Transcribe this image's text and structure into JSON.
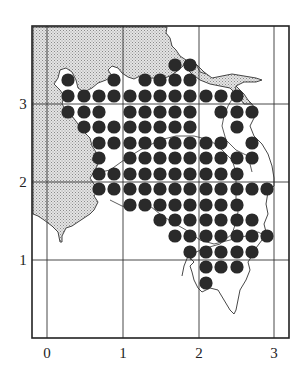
{
  "figure": {
    "type": "grid-distribution-map",
    "frame": {
      "left": 32,
      "top": 26,
      "right": 289,
      "bottom": 338
    },
    "colors": {
      "dot": "#2a2a2a",
      "land_shade": "#cfcfcf",
      "grid": "#333333",
      "coast": "#333333",
      "background": "#ffffff"
    },
    "x_axis": {
      "ticks": [
        {
          "label": "0",
          "px": 47
        },
        {
          "label": "1",
          "px": 123
        },
        {
          "label": "2",
          "px": 199
        },
        {
          "label": "3",
          "px": 274
        }
      ]
    },
    "y_axis": {
      "ticks": [
        {
          "label": "3",
          "px": 104
        },
        {
          "label": "2",
          "px": 182
        },
        {
          "label": "1",
          "px": 260
        }
      ]
    },
    "dot_radius": 6.6,
    "dot_columns_px": [
      68,
      84,
      99,
      114,
      130,
      145,
      160,
      175,
      190,
      206,
      221,
      237,
      252,
      267
    ],
    "dot_rows": [
      {
        "y": 65,
        "x": [
          175,
          190
        ]
      },
      {
        "y": 80,
        "x": [
          68,
          114,
          145,
          160,
          175,
          190
        ]
      },
      {
        "y": 96,
        "x": [
          68,
          84,
          99,
          114,
          130,
          145,
          160,
          175,
          190,
          206,
          221,
          237
        ]
      },
      {
        "y": 112,
        "x": [
          68,
          84,
          99,
          130,
          145,
          160,
          175,
          190,
          221,
          237,
          252
        ]
      },
      {
        "y": 127,
        "x": [
          84,
          99,
          114,
          130,
          145,
          160,
          175,
          190,
          237
        ]
      },
      {
        "y": 143,
        "x": [
          99,
          114,
          130,
          145,
          160,
          175,
          190,
          206,
          221,
          252
        ]
      },
      {
        "y": 158,
        "x": [
          99,
          130,
          145,
          160,
          175,
          190,
          206,
          221,
          237,
          252
        ]
      },
      {
        "y": 174,
        "x": [
          99,
          114,
          130,
          145,
          160,
          175,
          190,
          206,
          221,
          237
        ]
      },
      {
        "y": 189,
        "x": [
          99,
          114,
          130,
          145,
          160,
          175,
          190,
          206,
          221,
          237,
          252,
          267
        ]
      },
      {
        "y": 205,
        "x": [
          130,
          145,
          160,
          175,
          190,
          206,
          221,
          237
        ]
      },
      {
        "y": 220,
        "x": [
          160,
          175,
          190,
          206,
          221,
          237,
          252
        ]
      },
      {
        "y": 236,
        "x": [
          175,
          190,
          206,
          221,
          237,
          252,
          267
        ]
      },
      {
        "y": 252,
        "x": [
          190,
          206,
          221,
          237,
          252
        ]
      },
      {
        "y": 267,
        "x": [
          206,
          221,
          237
        ]
      },
      {
        "y": 283,
        "x": [
          206
        ]
      }
    ]
  }
}
